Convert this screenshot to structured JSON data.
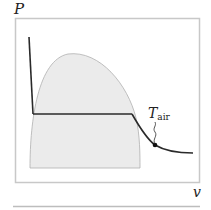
{
  "diagram": {
    "type": "P-v phase diagram",
    "y_axis_label": "P",
    "x_axis_label": "v",
    "annotation": {
      "main": "T",
      "subscript": "air"
    },
    "colors": {
      "frame": "#c8c8c8",
      "dome_fill": "#ebebeb",
      "dome_stroke": "#b0b0b0",
      "isotherm": "#2a2a2a",
      "point": "#111111"
    }
  }
}
